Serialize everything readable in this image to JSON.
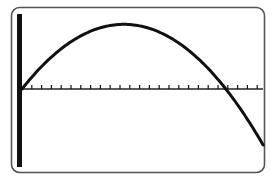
{
  "chart_data": {
    "type": "line",
    "title": "",
    "xlabel": "",
    "ylabel": "",
    "grid": false,
    "legend": null,
    "series": [
      {
        "name": "parabola",
        "x": [
          0,
          2,
          4,
          6,
          8,
          10,
          12,
          14,
          16,
          18,
          20,
          22,
          24
        ],
        "values": [
          0,
          2.2,
          4.0,
          5.3,
          6.2,
          6.6,
          6.6,
          6.1,
          5.1,
          3.8,
          1.8,
          -0.6,
          -3.7
        ]
      }
    ],
    "xlim": [
      0,
      24.5
    ],
    "ylim": [
      -8,
      7.5
    ],
    "x_ticks": [
      1,
      2,
      3,
      4,
      5,
      6,
      7,
      8,
      9,
      10,
      11,
      12,
      13,
      14,
      15,
      16,
      17,
      18,
      19,
      20,
      21,
      22,
      23,
      24
    ],
    "tick_labels_shown": false,
    "colors": {
      "curve": "#111111",
      "axis": "#111111",
      "frame": "#555555",
      "background": "#ffffff"
    }
  }
}
